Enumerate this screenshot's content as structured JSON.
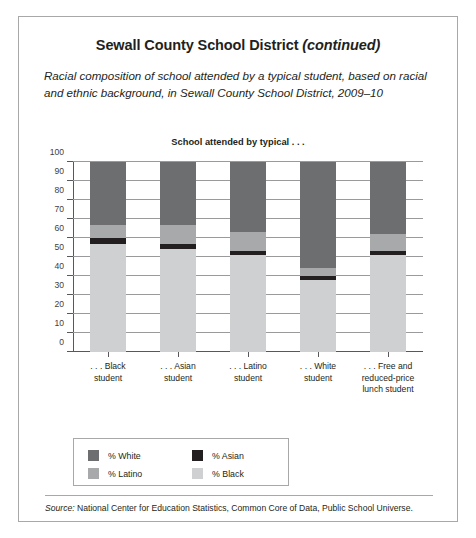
{
  "card": {
    "title_main": "Sewall County School District ",
    "title_emphasis": "(continued)",
    "subtitle": "Racial composition of school attended by a typical student, based on racial and ethnic background, in Sewall County School District, 2009–10",
    "plot_heading": "School attended by typical . . .",
    "source_label": "Source:",
    "source_text": " National Center for Education Statistics, Common Core of Data, Public School Universe."
  },
  "colors": {
    "white_pct": "#6d6e70",
    "latino_pct": "#a7a9ab",
    "asian_pct": "#231f20",
    "black_pct": "#cfd0d1",
    "axis": "#58585a",
    "grid": "#9a9a9c",
    "border": "#a8a8a8",
    "text": "#231f20"
  },
  "legend": {
    "items": [
      {
        "label": "% White",
        "color_key": "white_pct"
      },
      {
        "label": "% Asian",
        "color_key": "asian_pct"
      },
      {
        "label": "% Latino",
        "color_key": "latino_pct"
      },
      {
        "label": "% Black",
        "color_key": "black_pct"
      }
    ]
  },
  "chart_data": {
    "type": "bar",
    "subtype": "stacked-column",
    "title": "School attended by typical . . .",
    "xlabel": "",
    "ylabel": "",
    "ylim": [
      0,
      100
    ],
    "yticks": [
      0,
      10,
      20,
      30,
      40,
      50,
      60,
      70,
      80,
      90,
      100
    ],
    "ytick_labels": [
      "0",
      "10",
      "20",
      "30",
      "40",
      "50",
      "60",
      "70",
      "80",
      "90",
      "100"
    ],
    "grid": true,
    "legend_position": "below-plot",
    "categories": [
      ". . . Black\nstudent",
      ". . . Asian\nstudent",
      ". . . Latino\nstudent",
      ". . . White\nstudent",
      ". . . Free and\nreduced-price\nlunch student"
    ],
    "category_lines": [
      [
        ". . . Black",
        "student"
      ],
      [
        ". . . Asian",
        "student"
      ],
      [
        ". . . Latino",
        "student"
      ],
      [
        ". . . White",
        "student"
      ],
      [
        ". . . Free and",
        "reduced-price",
        "lunch student"
      ]
    ],
    "series": [
      {
        "name": "% Black",
        "color_key": "black_pct",
        "values": [
          57,
          54,
          51,
          38,
          51
        ]
      },
      {
        "name": "% Asian",
        "color_key": "asian_pct",
        "values": [
          3,
          3,
          2,
          2,
          2
        ]
      },
      {
        "name": "% Latino",
        "color_key": "latino_pct",
        "values": [
          7,
          10,
          10,
          4,
          9
        ]
      },
      {
        "name": "% White",
        "color_key": "white_pct",
        "values": [
          33,
          33,
          37,
          56,
          38
        ]
      }
    ]
  }
}
